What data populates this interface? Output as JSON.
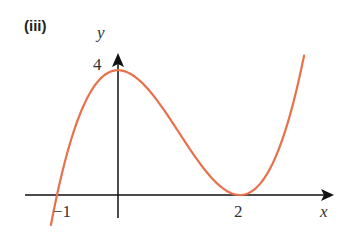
{
  "part_label": "(iii)",
  "chart_data": {
    "type": "line",
    "title": "",
    "xlabel": "x",
    "ylabel": "y",
    "function": "y = (x + 1)(x - 2)^2",
    "x_ticks": [
      {
        "value": -1,
        "label": "-1"
      },
      {
        "value": 2,
        "label": "2"
      }
    ],
    "y_ticks": [
      {
        "value": 4,
        "label": "4"
      }
    ],
    "key_points": [
      {
        "x": -1,
        "y": 0,
        "note": "root"
      },
      {
        "x": 0,
        "y": 4,
        "note": "local maximum / y-intercept"
      },
      {
        "x": 2,
        "y": 0,
        "note": "repeated root / local minimum touching axis"
      }
    ],
    "x": [
      -1.1,
      -1,
      -0.5,
      0,
      0.5,
      1,
      1.5,
      2,
      2.5,
      3
    ],
    "values": [
      -0.44,
      0,
      3.125,
      4,
      3.375,
      2,
      0.625,
      0,
      0.875,
      4
    ],
    "xlim": [
      -1.5,
      3.5
    ],
    "ylim": [
      -0.8,
      4.6
    ],
    "grid": false,
    "legend": null,
    "colors": {
      "curve": "#e8704a",
      "axes": "#111111"
    }
  },
  "axes": {
    "x_label": "x",
    "y_label": "y",
    "tick_minus1": "−1",
    "tick_2": "2",
    "tick_4": "4"
  }
}
